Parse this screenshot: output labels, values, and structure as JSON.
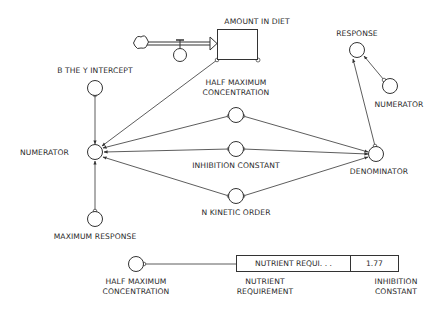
{
  "diagram": {
    "type": "stella-model",
    "stock": {
      "label": "AMOUNT IN DIET",
      "x": 217,
      "y": 29,
      "w": 41,
      "h": 31,
      "label_x": 257,
      "label_y": 17
    },
    "source": {
      "icon": "cloud-icon",
      "x": 140,
      "y": 43
    },
    "flow_valve": {
      "x": 180,
      "y": 55
    },
    "nodes": [
      {
        "id": "b_y_intercept",
        "label": "B THE Y INTERCEPT",
        "x": 95,
        "y": 88,
        "label_lines": [
          "B THE Y INTERCEPT"
        ],
        "label_x": 95,
        "label_y": 66
      },
      {
        "id": "half_max_conc",
        "label": "HALF MAXIMUM CONCENTRATION",
        "x": 236,
        "y": 115,
        "label_lines": [
          "HALF MAXIMUM",
          "CONCENTRATION"
        ],
        "label_x": 236,
        "label_y": 78
      },
      {
        "id": "numerator",
        "label": "NUMERATOR",
        "x": 95,
        "y": 152,
        "label_lines": [
          "NUMERATOR"
        ],
        "label_x": 20,
        "label_y": 148,
        "label_align": "left"
      },
      {
        "id": "inhibition_constant",
        "label": "INHIBITION CONSTANT",
        "x": 236,
        "y": 149,
        "label_lines": [
          "INHIBITION CONSTANT"
        ],
        "label_x": 236,
        "label_y": 161
      },
      {
        "id": "n_kinetic_order",
        "label": "N KINETIC ORDER",
        "x": 236,
        "y": 196,
        "label_lines": [
          "N KINETIC ORDER"
        ],
        "label_x": 236,
        "label_y": 208
      },
      {
        "id": "max_response",
        "label": "MAXIMUM RESPONSE",
        "x": 95,
        "y": 219,
        "label_lines": [
          "MAXIMUM RESPONSE"
        ],
        "label_x": 95,
        "label_y": 232
      },
      {
        "id": "denominator",
        "label": "DENOMINATOR",
        "x": 376,
        "y": 154,
        "label_lines": [
          "DENOMINATOR"
        ],
        "label_x": 379,
        "label_y": 167
      },
      {
        "id": "response",
        "label": "RESPONSE",
        "x": 357,
        "y": 50,
        "label_lines": [
          "RESPONSE"
        ],
        "label_x": 357,
        "label_y": 29
      },
      {
        "id": "numerator_2",
        "label": "NUMERATOR",
        "x": 390,
        "y": 86,
        "label_lines": [
          "NUMERATOR"
        ],
        "label_x": 399,
        "label_y": 100
      },
      {
        "id": "half_max_conc_2",
        "label": "HALF MAXIMUM CONCENTRATION",
        "x": 136,
        "y": 264,
        "label_lines": [
          "HALF MAXIMUM",
          "CONCENTRATION"
        ],
        "label_x": 136,
        "label_y": 277
      },
      {
        "id": "nutrient_requirement",
        "label": "NUTRIENT REQUIREMENT",
        "x": 262,
        "y": 264,
        "label_lines": [
          "NUTRIENT",
          "REQUIREMENT"
        ],
        "label_x": 265,
        "label_y": 277
      },
      {
        "id": "inhibition_constant_2",
        "label": "INHIBITION CONSTANT",
        "x": 383,
        "y": 264,
        "label_lines": [
          "INHIBITION",
          "CONSTANT"
        ],
        "label_x": 396,
        "label_y": 277
      }
    ],
    "connectors": [
      {
        "from": "stock_corner",
        "to": "numerator",
        "x1": 217,
        "y1": 60,
        "x2": 102,
        "y2": 146
      },
      {
        "from": "b_y_intercept",
        "to": "numerator",
        "x1": 95,
        "y1": 95,
        "x2": 95,
        "y2": 144
      },
      {
        "from": "half_max_conc",
        "to": "numerator",
        "x1": 229,
        "y1": 116,
        "x2": 103,
        "y2": 148
      },
      {
        "from": "inhibition_constant",
        "to": "numerator",
        "x1": 229,
        "y1": 149,
        "x2": 104,
        "y2": 152
      },
      {
        "from": "n_kinetic_order",
        "to": "numerator",
        "x1": 229,
        "y1": 196,
        "x2": 103,
        "y2": 157
      },
      {
        "from": "max_response",
        "to": "numerator",
        "x1": 95,
        "y1": 211,
        "x2": 95,
        "y2": 161
      },
      {
        "from": "half_max_conc",
        "to": "denominator",
        "x1": 243,
        "y1": 116,
        "x2": 368,
        "y2": 152
      },
      {
        "from": "inhibition_constant",
        "to": "denominator",
        "x1": 243,
        "y1": 149,
        "x2": 368,
        "y2": 154
      },
      {
        "from": "n_kinetic_order",
        "to": "denominator",
        "x1": 243,
        "y1": 196,
        "x2": 368,
        "y2": 157
      },
      {
        "from": "denominator",
        "to": "response",
        "x1": 375,
        "y1": 146,
        "x2": 353,
        "y2": 59
      },
      {
        "from": "numerator_2",
        "to": "response",
        "x1": 384,
        "y1": 80,
        "x2": 364,
        "y2": 56
      },
      {
        "from": "half_max_conc_2",
        "to": "nutrient_requirement",
        "x1": 144,
        "y1": 264,
        "x2": 254,
        "y2": 264
      },
      {
        "from": "inhibition_constant_2",
        "to": "nutrient_requirement",
        "x1": 375,
        "y1": 264,
        "x2": 270,
        "y2": 264
      }
    ],
    "table": {
      "name": "NUTRIENT REQUI. . .",
      "value": "1.77",
      "x": 236,
      "y": 255,
      "w": 163,
      "h": 17
    }
  }
}
